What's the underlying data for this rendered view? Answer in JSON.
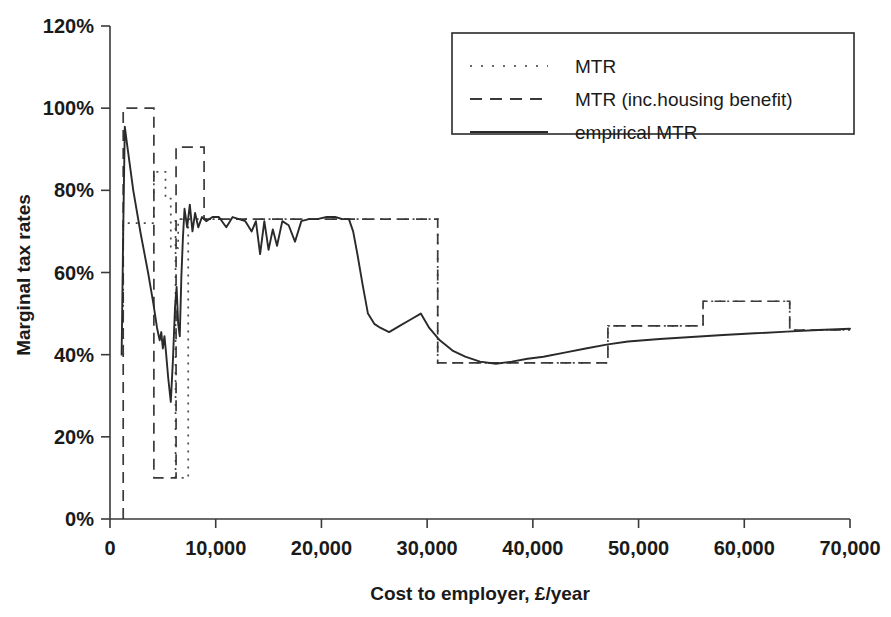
{
  "chart_data": {
    "type": "line",
    "title": "",
    "xlabel": "Cost to employer, £/year",
    "ylabel": "Marginal tax rates",
    "xlim": [
      0,
      70000
    ],
    "ylim": [
      0,
      1.2
    ],
    "grid": false,
    "legend_position": "top-right",
    "xticks": [
      0,
      10000,
      20000,
      30000,
      40000,
      50000,
      60000,
      70000
    ],
    "xtick_labels": [
      "0",
      "10,000",
      "20,000",
      "30,000",
      "40,000",
      "50,000",
      "60,000",
      "70,000"
    ],
    "yticks": [
      0,
      0.2,
      0.4,
      0.6,
      0.8,
      1.0,
      1.2
    ],
    "ytick_labels": [
      "0%",
      "20%",
      "40%",
      "60%",
      "80%",
      "100%",
      "120%"
    ],
    "series": [
      {
        "name": "MTR",
        "style": "dotted",
        "color": "#4a4a4a",
        "points": [
          [
            1250,
            0.4
          ],
          [
            1250,
            0.72
          ],
          [
            4150,
            0.72
          ],
          [
            4150,
            0.845
          ],
          [
            5250,
            0.845
          ],
          [
            5250,
            0.78
          ],
          [
            5750,
            0.78
          ],
          [
            5750,
            0.66
          ],
          [
            6450,
            0.66
          ],
          [
            6450,
            0.73
          ],
          [
            7400,
            0.73
          ],
          [
            7400,
            0.55
          ],
          [
            7400,
            0.4
          ],
          [
            7400,
            0.17
          ],
          [
            7400,
            0.1
          ],
          [
            6200,
            0.1
          ],
          [
            6200,
            0.4
          ],
          [
            6200,
            0.73
          ],
          [
            9000,
            0.73
          ],
          [
            22800,
            0.73
          ],
          [
            22800,
            0.73
          ],
          [
            31000,
            0.73
          ],
          [
            31000,
            0.38
          ],
          [
            36500,
            0.38
          ],
          [
            47100,
            0.38
          ],
          [
            47100,
            0.47
          ],
          [
            56100,
            0.47
          ],
          [
            56100,
            0.53
          ],
          [
            64300,
            0.53
          ],
          [
            64300,
            0.46
          ],
          [
            70000,
            0.46
          ]
        ]
      },
      {
        "name": "MTR (inc.housing benefit)",
        "style": "dashed",
        "color": "#3a3a3a",
        "points": [
          [
            1250,
            0.0
          ],
          [
            1250,
            1.0
          ],
          [
            4150,
            1.0
          ],
          [
            4150,
            0.1
          ],
          [
            6250,
            0.1
          ],
          [
            6250,
            0.905
          ],
          [
            8900,
            0.905
          ],
          [
            8900,
            0.73
          ],
          [
            22800,
            0.73
          ],
          [
            31000,
            0.73
          ],
          [
            31000,
            0.38
          ],
          [
            47100,
            0.38
          ],
          [
            47100,
            0.47
          ],
          [
            56100,
            0.47
          ],
          [
            56100,
            0.53
          ],
          [
            64300,
            0.53
          ],
          [
            64300,
            0.46
          ],
          [
            70000,
            0.46
          ]
        ]
      },
      {
        "name": "empirical MTR",
        "style": "solid",
        "color": "#2a2a2a",
        "points": [
          [
            1100,
            0.4
          ],
          [
            1250,
            0.7
          ],
          [
            1400,
            0.955
          ],
          [
            1600,
            0.915
          ],
          [
            2200,
            0.8
          ],
          [
            2900,
            0.695
          ],
          [
            3600,
            0.6
          ],
          [
            4100,
            0.525
          ],
          [
            4450,
            0.465
          ],
          [
            4700,
            0.435
          ],
          [
            4850,
            0.455
          ],
          [
            5000,
            0.415
          ],
          [
            5150,
            0.445
          ],
          [
            5300,
            0.405
          ],
          [
            5500,
            0.345
          ],
          [
            5750,
            0.285
          ],
          [
            5950,
            0.385
          ],
          [
            6150,
            0.515
          ],
          [
            6300,
            0.565
          ],
          [
            6450,
            0.475
          ],
          [
            6600,
            0.445
          ],
          [
            6750,
            0.59
          ],
          [
            6900,
            0.685
          ],
          [
            7050,
            0.755
          ],
          [
            7300,
            0.71
          ],
          [
            7550,
            0.765
          ],
          [
            7800,
            0.7
          ],
          [
            8050,
            0.745
          ],
          [
            8350,
            0.71
          ],
          [
            8700,
            0.735
          ],
          [
            9100,
            0.725
          ],
          [
            9700,
            0.735
          ],
          [
            10300,
            0.735
          ],
          [
            11000,
            0.71
          ],
          [
            11600,
            0.735
          ],
          [
            12200,
            0.73
          ],
          [
            12800,
            0.725
          ],
          [
            13400,
            0.7
          ],
          [
            13800,
            0.725
          ],
          [
            14200,
            0.645
          ],
          [
            14600,
            0.725
          ],
          [
            15000,
            0.655
          ],
          [
            15400,
            0.705
          ],
          [
            15800,
            0.665
          ],
          [
            16300,
            0.725
          ],
          [
            16900,
            0.715
          ],
          [
            17500,
            0.675
          ],
          [
            18100,
            0.725
          ],
          [
            18800,
            0.73
          ],
          [
            19600,
            0.73
          ],
          [
            20500,
            0.735
          ],
          [
            21300,
            0.735
          ],
          [
            22000,
            0.73
          ],
          [
            22600,
            0.73
          ],
          [
            23000,
            0.7
          ],
          [
            23400,
            0.645
          ],
          [
            23900,
            0.57
          ],
          [
            24400,
            0.5
          ],
          [
            25000,
            0.475
          ],
          [
            25600,
            0.465
          ],
          [
            26400,
            0.455
          ],
          [
            27400,
            0.47
          ],
          [
            28400,
            0.485
          ],
          [
            29400,
            0.5
          ],
          [
            30200,
            0.465
          ],
          [
            31200,
            0.435
          ],
          [
            32400,
            0.41
          ],
          [
            33600,
            0.395
          ],
          [
            35000,
            0.383
          ],
          [
            36500,
            0.378
          ],
          [
            38000,
            0.383
          ],
          [
            39500,
            0.39
          ],
          [
            41000,
            0.395
          ],
          [
            43000,
            0.405
          ],
          [
            45000,
            0.415
          ],
          [
            47100,
            0.425
          ],
          [
            49000,
            0.432
          ],
          [
            52000,
            0.438
          ],
          [
            55000,
            0.443
          ],
          [
            58000,
            0.448
          ],
          [
            61000,
            0.452
          ],
          [
            64000,
            0.456
          ],
          [
            67000,
            0.46
          ],
          [
            70000,
            0.463
          ]
        ]
      }
    ]
  },
  "legend": {
    "items": [
      {
        "label": "MTR",
        "style": "dotted"
      },
      {
        "label": "MTR (inc.housing benefit)",
        "style": "dashed"
      },
      {
        "label": "empirical MTR",
        "style": "solid"
      }
    ]
  }
}
